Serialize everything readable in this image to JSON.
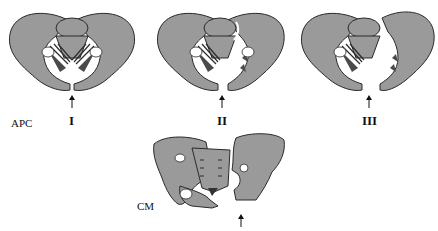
{
  "figure": {
    "group_labels": {
      "apc": "APC",
      "cm": "CM"
    },
    "panels": [
      {
        "id": "apc-1",
        "grade": "I"
      },
      {
        "id": "apc-2",
        "grade": "II"
      },
      {
        "id": "apc-3",
        "grade": "III"
      },
      {
        "id": "cm",
        "grade": ""
      }
    ],
    "colors": {
      "bone_fill": "#9a9a9a",
      "outline": "#2a2a2a",
      "background": "#ffffff"
    }
  }
}
